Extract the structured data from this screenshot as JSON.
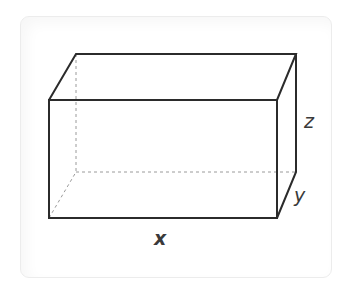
{
  "figure": {
    "type": "rectangular-prism",
    "labels": {
      "x": "x",
      "y": "y",
      "z": "z"
    },
    "colors": {
      "edge": "#2b2b2b",
      "hidden_edge": "#9a9a9a",
      "label": "#3a3a3a",
      "card_border": "#ececec"
    }
  }
}
